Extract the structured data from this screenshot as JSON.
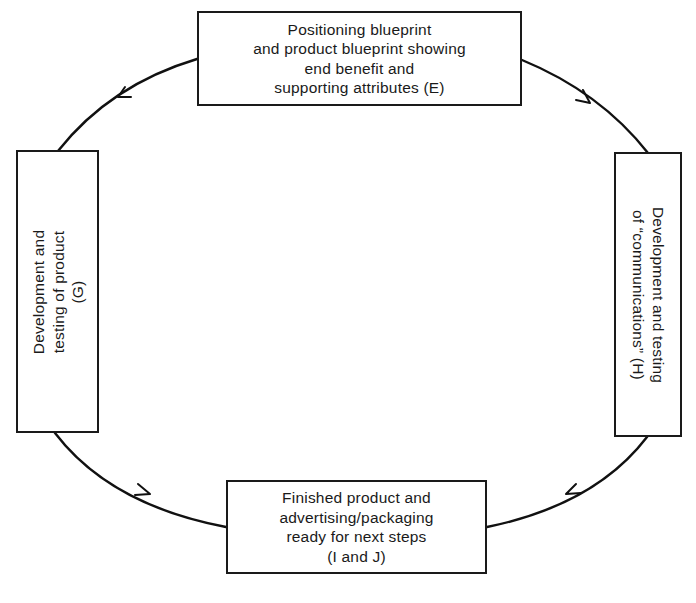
{
  "diagram": {
    "type": "cycle-flowchart",
    "line_color": "#111111",
    "box_border_color": "#1a1a1a",
    "background_color": "#ffffff",
    "nodes": [
      {
        "id": "E",
        "position": "top",
        "orientation": "horizontal",
        "lines": [
          "Positioning blueprint",
          "and product blueprint showing",
          "end benefit and",
          "supporting attributes (E)"
        ]
      },
      {
        "id": "G",
        "position": "left",
        "orientation": "rotated-counterclockwise",
        "lines": [
          "Development and",
          "testing of product",
          "(G)"
        ]
      },
      {
        "id": "H",
        "position": "right",
        "orientation": "rotated-clockwise",
        "lines": [
          "Development and testing",
          "of “communications” (H)"
        ]
      },
      {
        "id": "IJ",
        "position": "bottom",
        "orientation": "horizontal",
        "lines": [
          "Finished product and",
          "advertising/packaging",
          "ready for next steps",
          "(I and J)"
        ]
      }
    ],
    "edges": [
      {
        "from": "E",
        "to": "G",
        "direction": "counterclockwise"
      },
      {
        "from": "G",
        "to": "IJ",
        "direction": "counterclockwise"
      },
      {
        "from": "E",
        "to": "H",
        "direction": "clockwise"
      },
      {
        "from": "H",
        "to": "IJ",
        "direction": "clockwise"
      }
    ]
  }
}
